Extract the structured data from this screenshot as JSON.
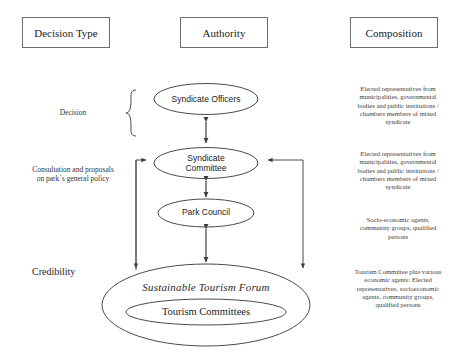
{
  "diagram": {
    "title_columns": [
      {
        "id": "decision-type",
        "label": "Decision Type"
      },
      {
        "id": "authority",
        "label": "Authority"
      },
      {
        "id": "composition",
        "label": "Composition"
      }
    ],
    "left_column": [
      {
        "id": "decision",
        "label": "Decision"
      },
      {
        "id": "consultation",
        "label": "Consultation and proposals on park`s general policy"
      },
      {
        "id": "credibility",
        "label": "Credibility"
      }
    ],
    "nodes": [
      {
        "id": "syndicate-officers",
        "label": "Syndicate Officers",
        "shape": "ellipse"
      },
      {
        "id": "syndicate-committee",
        "label": "Syndicate Committee",
        "shape": "ellipse"
      },
      {
        "id": "park-council",
        "label": "Park Council",
        "shape": "ellipse"
      },
      {
        "id": "sustainable-tourism-forum",
        "label": "Sustainable Tourism Forum",
        "shape": "ellipse"
      },
      {
        "id": "tourism-committees",
        "label": "Tourism Committees",
        "shape": "ellipse"
      }
    ],
    "right_column": [
      {
        "id": "composition-officers",
        "label": "Elected representatives from municipalities, governmental bodies and public institutions / chambers members of mixed syndicate"
      },
      {
        "id": "composition-committee",
        "label": "Elected representatives from municipalities, governmental bodies and public institutions / chambers members of mixed syndicate"
      },
      {
        "id": "composition-park-council",
        "label": "Socio-economic agents, community groups, qualified persons"
      },
      {
        "id": "composition-forum",
        "label": "Tourism Committee plus various economic agents: Elected representatives, socioeconomic agents, community groups, qualified persons"
      }
    ],
    "colors": {
      "stroke": "#4a4a4a",
      "box_border": "#6d6d6d",
      "text": "#1b1b1b",
      "background": "#ffffff"
    }
  }
}
